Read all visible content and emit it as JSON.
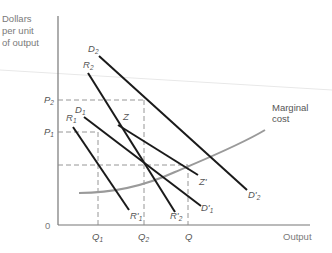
{
  "diagram": {
    "y_axis_label": [
      "Dollars",
      "per unit",
      "of output"
    ],
    "x_axis_label": "Output",
    "origin_label": "0",
    "price_labels": [
      {
        "name": "P2",
        "base": "P",
        "sub": "2"
      },
      {
        "name": "P1",
        "base": "P",
        "sub": "1"
      }
    ],
    "quantity_labels": [
      {
        "name": "Q1",
        "base": "Q",
        "sub": "1"
      },
      {
        "name": "Q2",
        "base": "Q",
        "sub": "2"
      },
      {
        "name": "Q",
        "base": "Q",
        "sub": ""
      }
    ],
    "curves": [
      {
        "name": "D2",
        "start_label": "D2",
        "end_label": "D'2"
      },
      {
        "name": "R2",
        "start_label": "R2",
        "end_label": "R'2"
      },
      {
        "name": "D1",
        "start_label": "D1",
        "end_label": "D'1"
      },
      {
        "name": "R1",
        "start_label": "R1",
        "end_label": "R'1"
      },
      {
        "name": "Z",
        "start_label": "Z",
        "end_label": "Z'"
      }
    ],
    "marginal_cost_label": [
      "Marginal",
      "cost"
    ],
    "colors": {
      "axis": "#777777",
      "curve": "#1a1a1a",
      "marginal_cost": "#9a9a9a",
      "dashed": "#8a8a8a",
      "text": "#6f6f6f"
    }
  }
}
